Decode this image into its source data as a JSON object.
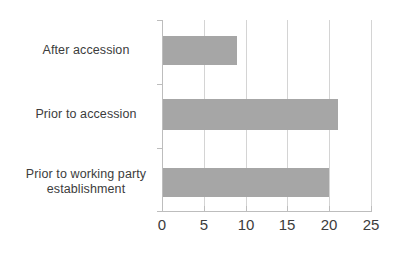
{
  "chart_data": {
    "type": "bar",
    "orientation": "horizontal",
    "title": "",
    "subtitle": "",
    "xlabel": "",
    "ylabel": "",
    "categories": [
      "Prior to working party establishment",
      "Prior to accession",
      "After accession"
    ],
    "values": [
      20,
      21,
      9
    ],
    "series": [
      {
        "name": "",
        "values": [
          20,
          21,
          9
        ]
      }
    ],
    "xlim": [
      0,
      25
    ],
    "xticks": [
      0,
      5,
      10,
      15,
      20,
      25
    ],
    "xtick_labels": [
      "0",
      "5",
      "10",
      "15",
      "20",
      "25"
    ],
    "grid": true,
    "grid_axis": "x",
    "legend": false,
    "legend_position": "none",
    "annotations": [],
    "colors": {
      "bar": "#a6a6a6",
      "gridline": "#d4d4d4",
      "axis": "#bdbdbd",
      "text": "#3c3c3c",
      "background": "#ffffff"
    }
  },
  "axis": {
    "ticks": [
      {
        "label": "0",
        "value": 0
      },
      {
        "label": "5",
        "value": 5
      },
      {
        "label": "10",
        "value": 10
      },
      {
        "label": "15",
        "value": 15
      },
      {
        "label": "20",
        "value": 20
      },
      {
        "label": "25",
        "value": 25
      }
    ]
  },
  "categories": [
    {
      "label": "After accession",
      "value": 9
    },
    {
      "label": "Prior to accession",
      "value": 21
    },
    {
      "label": "Prior to working party\nestablishment",
      "value": 20
    }
  ]
}
